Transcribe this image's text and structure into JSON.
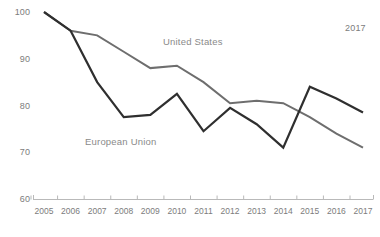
{
  "chart_data": {
    "type": "line",
    "title": "",
    "xlabel": "",
    "ylabel": "",
    "grid": false,
    "legend_position": "inline-annotation",
    "categories": [
      "2005",
      "2006",
      "2007",
      "2008",
      "2009",
      "2010",
      "2011",
      "2012",
      "2013",
      "2014",
      "2015",
      "2016",
      "2017"
    ],
    "x": [
      2005,
      2006,
      2007,
      2008,
      2009,
      2010,
      2011,
      2012,
      2013,
      2014,
      2015,
      2016,
      2017
    ],
    "ylim": [
      60,
      100
    ],
    "yticks": [
      60,
      70,
      80,
      90,
      100
    ],
    "ytick_labels": [
      "60",
      "70",
      "80",
      "90",
      "100"
    ],
    "series": [
      {
        "name": "United States",
        "color": "#6e6e6e",
        "values": [
          100,
          96,
          95,
          91.5,
          88,
          88.5,
          85,
          80.5,
          81,
          80.5,
          77.5,
          74,
          71
        ]
      },
      {
        "name": "European Union",
        "color": "#2f2f2f",
        "values": [
          100,
          96,
          85,
          77.5,
          78,
          82.5,
          74.5,
          79.5,
          76,
          71,
          84,
          81.5,
          78.5
        ]
      }
    ],
    "annotations": [
      {
        "name": "united-states-label",
        "text": "United States",
        "x_px": 163,
        "y_px": 36
      },
      {
        "name": "european-union-label",
        "text": "European Union",
        "x_px": 85,
        "y_px": 136
      },
      {
        "name": "year-note",
        "text": "2017",
        "x_px": 345,
        "y_px": 23
      }
    ]
  },
  "axis": {
    "y_tick_labels": [
      "100",
      "90",
      "80",
      "70",
      "60"
    ],
    "x_tick_labels": [
      "2005",
      "2006",
      "2007",
      "2008",
      "2009",
      "2010",
      "2011",
      "2012",
      "2013",
      "2014",
      "2015",
      "2016",
      "2017"
    ]
  },
  "colors": {
    "united_states": "#6e6e6e",
    "european_union": "#2f2f2f",
    "axis": "#b9b9b9",
    "label_text": "#7c7c7c",
    "background": "#ffffff"
  }
}
